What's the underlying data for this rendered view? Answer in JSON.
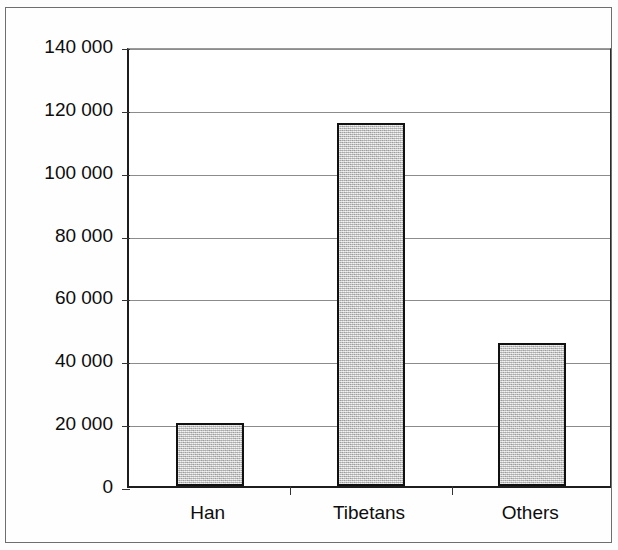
{
  "chart_data": {
    "type": "bar",
    "title": "",
    "subtitle": "",
    "xlabel": "",
    "ylabel": "",
    "categories": [
      "Han",
      "Tibetans",
      "Others"
    ],
    "values": [
      20000,
      115500,
      45500
    ],
    "ylim": [
      0,
      140000
    ],
    "ytick_values": [
      0,
      20000,
      40000,
      60000,
      80000,
      100000,
      120000,
      140000
    ],
    "ytick_labels": [
      "0",
      "20 000",
      "40 000",
      "60 000",
      "80 000",
      "100 000",
      "120 000",
      "140 000"
    ],
    "grid": true,
    "grid_axis": "y",
    "legend": null,
    "legend_position": "none",
    "annotations": [],
    "bar_fill_color": "#c9c9c9",
    "bar_edge_color": "#111111",
    "grid_color": "#8c8c8c",
    "axis_color": "#1d1d1d",
    "background_color": "#ffffff",
    "frame_border_color": "#6e6e6e"
  }
}
